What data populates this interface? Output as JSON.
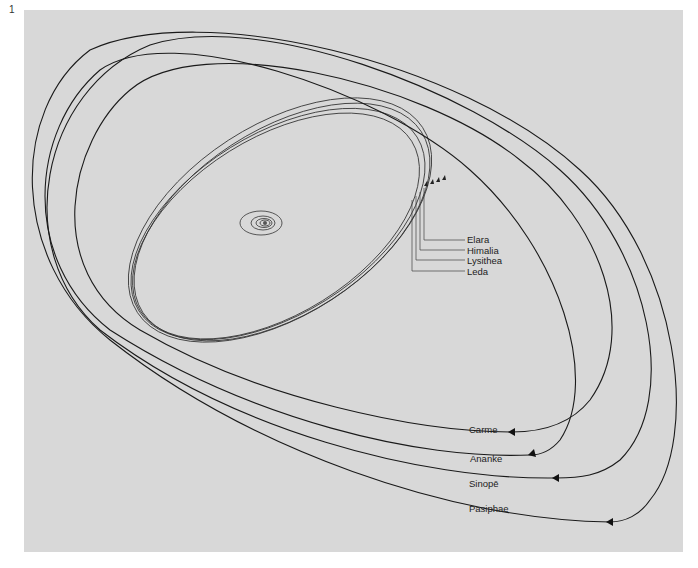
{
  "figure": {
    "number": "1",
    "background_color": "#d8d8d8",
    "line_color": "#222222"
  },
  "inner_group": {
    "labels": [
      "Elara",
      "Himalia",
      "Lysithea",
      "Leda"
    ]
  },
  "outer_group": {
    "labels": [
      "Carme",
      "Ananke",
      "Sinopē",
      "Pasiphae"
    ]
  },
  "central_system": {
    "description": "Jupiter with Galilean moon orbits"
  }
}
